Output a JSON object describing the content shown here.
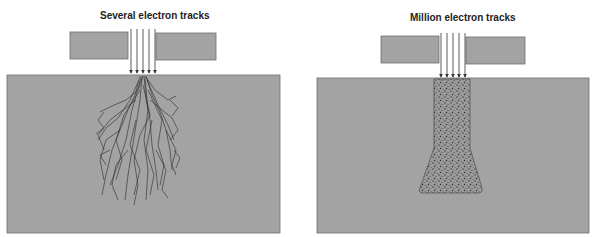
{
  "panels": [
    {
      "title": "Several electron tracks",
      "description": "few electron tracks scattering as branching lines in the target"
    },
    {
      "title": "Million electron tracks",
      "description": "many electron tracks forming a dense stippled interaction volume"
    }
  ],
  "colors": {
    "block": "#a3a3a3",
    "block_border": "#6e6e6e",
    "track": "#2a2a2a",
    "arrow": "#333333",
    "volume": "#8c8c8c"
  }
}
